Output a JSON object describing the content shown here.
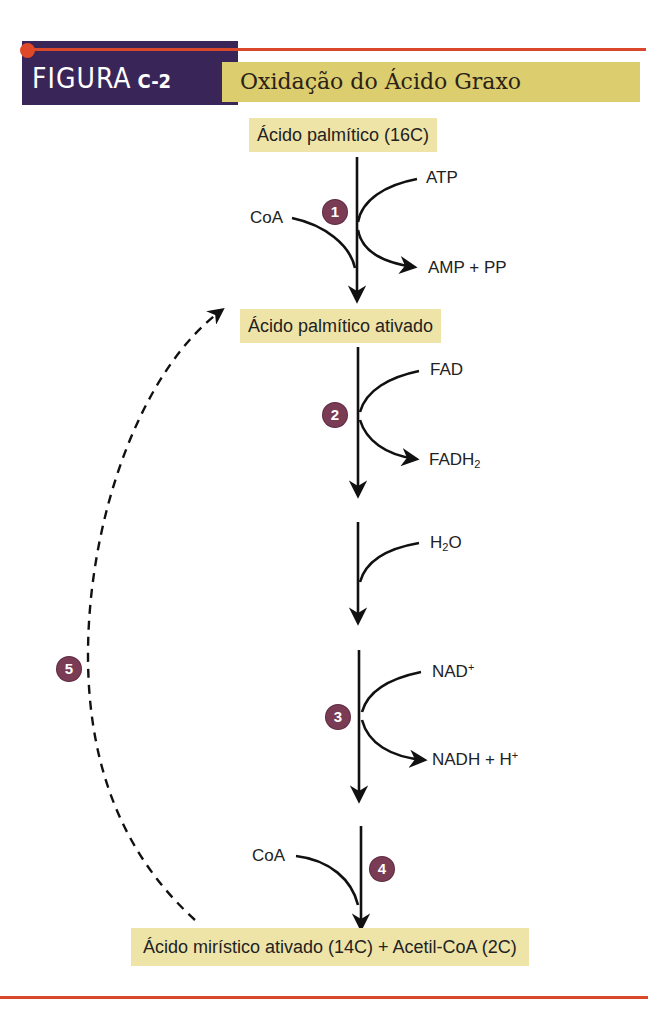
{
  "header": {
    "figure_label": "FIGURA",
    "figure_number": "C-2",
    "title": "Oxidação do Ácido Graxo",
    "colors": {
      "label_bg": "#3a2559",
      "title_bg": "#dccd6e",
      "rule": "#d9482a",
      "step_badge": "#7a3b55",
      "node_bg": "#efe4a8"
    }
  },
  "nodes": {
    "start": "Ácido palmítico (16C)",
    "activated": "Ácido palmítico ativado",
    "end": "Ácido mirístico ativado (14C) + Acetil-CoA (2C)"
  },
  "steps": [
    {
      "number": "1",
      "inputs": [
        "CoA",
        "ATP"
      ],
      "outputs": [
        "AMP + PP"
      ]
    },
    {
      "number": "2",
      "inputs": [
        "FAD"
      ],
      "outputs": [
        "FADH2"
      ]
    },
    {
      "number": "",
      "inputs": [
        "H2O"
      ],
      "outputs": []
    },
    {
      "number": "3",
      "inputs": [
        "NAD+"
      ],
      "outputs": [
        "NADH + H+"
      ]
    },
    {
      "number": "4",
      "inputs": [
        "CoA"
      ],
      "outputs": []
    },
    {
      "number": "5",
      "inputs": [],
      "outputs": [],
      "note": "dashed cycle back to activated palmitic acid"
    }
  ],
  "labels": {
    "coa1": "CoA",
    "atp": "ATP",
    "amp_pp": "AMP + PP",
    "fad": "FAD",
    "fadh_base": "FADH",
    "fadh_sub": "2",
    "h2o_h": "H",
    "h2o_sub": "2",
    "h2o_o": "O",
    "nad_base": "NAD",
    "nad_sup": "+",
    "nadh_base": "NADH + H",
    "nadh_sup": "+",
    "coa2": "CoA"
  },
  "step_badges": {
    "s1": "1",
    "s2": "2",
    "s3": "3",
    "s4": "4",
    "s5": "5"
  }
}
